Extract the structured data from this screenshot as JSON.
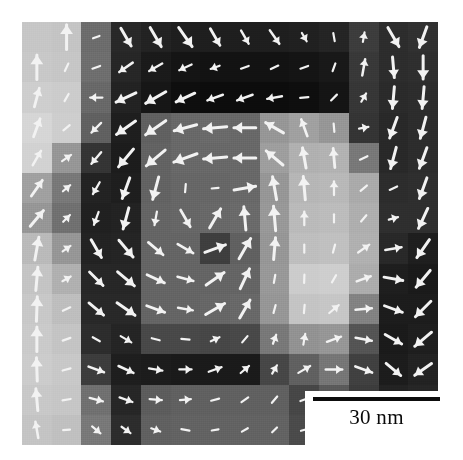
{
  "figure": {
    "type": "micrograph",
    "modality": "magnetic-vector-map"
  },
  "scalebar": {
    "label": "30 nm",
    "bar_color": "#0d0d0d",
    "background": "#ffffff",
    "length_px": 127,
    "value": 30,
    "unit": "nm"
  },
  "image": {
    "x": 22,
    "y": 22,
    "width": 416,
    "height": 423,
    "cols": 14,
    "rows": 14,
    "background": "#6b6b6b",
    "arrow_color": "#f2f2f2"
  },
  "chart_data": {
    "type": "heatmap",
    "title": "",
    "xlabel": "",
    "ylabel": "",
    "cols": 14,
    "rows": 14,
    "colormap": "grayscale",
    "vmin": 0,
    "vmax": 255,
    "annotations": [
      "30 nm"
    ],
    "grayscale_values": [
      [
        198,
        196,
        108,
        40,
        34,
        30,
        30,
        30,
        30,
        32,
        36,
        60,
        44,
        48
      ],
      [
        200,
        198,
        110,
        38,
        26,
        20,
        18,
        18,
        18,
        20,
        24,
        56,
        44,
        46
      ],
      [
        206,
        204,
        104,
        34,
        22,
        14,
        12,
        12,
        12,
        14,
        20,
        54,
        42,
        44
      ],
      [
        214,
        206,
        96,
        30,
        96,
        104,
        106,
        104,
        150,
        160,
        150,
        52,
        40,
        44
      ],
      [
        210,
        150,
        52,
        28,
        98,
        104,
        104,
        104,
        158,
        176,
        178,
        120,
        40,
        44
      ],
      [
        160,
        120,
        34,
        30,
        98,
        102,
        102,
        104,
        150,
        182,
        184,
        170,
        44,
        46
      ],
      [
        150,
        112,
        32,
        34,
        100,
        102,
        104,
        106,
        152,
        186,
        188,
        174,
        46,
        46
      ],
      [
        186,
        150,
        34,
        36,
        100,
        100,
        62,
        96,
        150,
        190,
        192,
        176,
        40,
        30
      ],
      [
        196,
        176,
        38,
        38,
        100,
        100,
        100,
        100,
        152,
        204,
        206,
        172,
        30,
        26
      ],
      [
        200,
        190,
        40,
        40,
        100,
        100,
        102,
        104,
        150,
        196,
        198,
        130,
        28,
        28
      ],
      [
        202,
        196,
        44,
        36,
        72,
        72,
        70,
        72,
        120,
        146,
        150,
        84,
        26,
        30
      ],
      [
        204,
        200,
        60,
        30,
        28,
        26,
        26,
        26,
        70,
        96,
        118,
        64,
        28,
        34
      ],
      [
        200,
        198,
        112,
        38,
        92,
        96,
        96,
        96,
        96,
        70,
        90,
        60,
        34,
        38
      ],
      [
        196,
        192,
        120,
        44,
        96,
        98,
        98,
        98,
        98,
        74,
        92,
        62,
        36,
        40
      ]
    ],
    "arrow_angles_deg": [
      [
        null,
        90,
        20,
        300,
        300,
        305,
        300,
        300,
        305,
        300,
        100,
        80,
        300,
        250
      ],
      [
        90,
        65,
        200,
        215,
        210,
        205,
        200,
        200,
        205,
        200,
        70,
        80,
        275,
        270
      ],
      [
        75,
        60,
        180,
        205,
        210,
        205,
        200,
        200,
        190,
        185,
        45,
        60,
        265,
        265
      ],
      [
        70,
        40,
        225,
        215,
        215,
        195,
        185,
        180,
        150,
        110,
        95,
        10,
        250,
        255
      ],
      [
        60,
        35,
        230,
        230,
        220,
        200,
        185,
        180,
        140,
        100,
        95,
        25,
        255,
        250
      ],
      [
        55,
        40,
        240,
        250,
        255,
        265,
        5,
        10,
        100,
        95,
        90,
        40,
        25,
        250
      ],
      [
        50,
        45,
        250,
        255,
        260,
        300,
        60,
        95,
        95,
        90,
        90,
        50,
        15,
        245
      ],
      [
        80,
        35,
        300,
        310,
        320,
        330,
        20,
        60,
        85,
        90,
        75,
        35,
        10,
        235
      ],
      [
        85,
        30,
        315,
        320,
        335,
        345,
        35,
        65,
        80,
        88,
        60,
        20,
        350,
        230
      ],
      [
        88,
        25,
        320,
        325,
        340,
        350,
        30,
        60,
        75,
        85,
        40,
        5,
        340,
        225
      ],
      [
        90,
        20,
        330,
        330,
        345,
        355,
        25,
        50,
        70,
        80,
        20,
        350,
        330,
        220
      ],
      [
        92,
        15,
        340,
        335,
        350,
        0,
        20,
        40,
        60,
        30,
        0,
        340,
        320,
        215
      ],
      [
        95,
        10,
        345,
        340,
        355,
        5,
        15,
        35,
        50,
        20,
        350,
        330,
        310,
        210
      ],
      [
        100,
        5,
        320,
        325,
        340,
        350,
        10,
        30,
        45,
        15,
        345,
        325,
        305,
        205
      ]
    ],
    "arrow_lengths": [
      [
        0,
        0.9,
        0.25,
        0.75,
        0.8,
        0.85,
        0.7,
        0.55,
        0.6,
        0.35,
        0.3,
        0.35,
        0.8,
        0.8
      ],
      [
        0.9,
        0.3,
        0.3,
        0.6,
        0.55,
        0.5,
        0.35,
        0.3,
        0.3,
        0.3,
        0.3,
        0.6,
        0.75,
        0.85
      ],
      [
        0.7,
        0.3,
        0.45,
        0.8,
        0.85,
        0.75,
        0.6,
        0.6,
        0.55,
        0.3,
        0.3,
        0.35,
        0.8,
        0.8
      ],
      [
        0.7,
        0.3,
        0.5,
        0.85,
        0.9,
        0.85,
        0.85,
        0.8,
        0.75,
        0.65,
        0.3,
        0.35,
        0.8,
        0.8
      ],
      [
        0.6,
        0.4,
        0.55,
        0.85,
        0.9,
        0.9,
        0.85,
        0.8,
        0.8,
        0.75,
        0.7,
        0.3,
        0.8,
        0.8
      ],
      [
        0.7,
        0.35,
        0.5,
        0.8,
        0.85,
        0.3,
        0.25,
        0.8,
        0.85,
        0.85,
        0.5,
        0.3,
        0.3,
        0.8
      ],
      [
        0.75,
        0.35,
        0.5,
        0.8,
        0.5,
        0.7,
        0.8,
        0.85,
        0.9,
        0.5,
        0.3,
        0.3,
        0.35,
        0.8
      ],
      [
        0.85,
        0.35,
        0.75,
        0.8,
        0.7,
        0.65,
        0.8,
        0.85,
        0.8,
        0.3,
        0.3,
        0.5,
        0.6,
        0.8
      ],
      [
        0.85,
        0.35,
        0.7,
        0.8,
        0.7,
        0.6,
        0.8,
        0.8,
        0.3,
        0.3,
        0.3,
        0.55,
        0.7,
        0.8
      ],
      [
        0.9,
        0.3,
        0.7,
        0.8,
        0.7,
        0.55,
        0.8,
        0.75,
        0.3,
        0.3,
        0.45,
        0.6,
        0.7,
        0.8
      ],
      [
        0.9,
        0.3,
        0.3,
        0.45,
        0.3,
        0.3,
        0.35,
        0.3,
        0.35,
        0.4,
        0.55,
        0.6,
        0.7,
        0.8
      ],
      [
        0.85,
        0.3,
        0.6,
        0.6,
        0.5,
        0.45,
        0.5,
        0.4,
        0.35,
        0.5,
        0.6,
        0.65,
        0.7,
        0.75
      ],
      [
        0.8,
        0.3,
        0.5,
        0.5,
        0.45,
        0.4,
        0.3,
        0.3,
        0.3,
        0.3,
        0.3,
        0.3,
        0.3,
        0.3
      ],
      [
        0.6,
        0.25,
        0.4,
        0.4,
        0.35,
        0.3,
        0.25,
        0.25,
        0.25,
        0.25,
        0.25,
        0.25,
        0.25,
        0.25
      ]
    ]
  }
}
